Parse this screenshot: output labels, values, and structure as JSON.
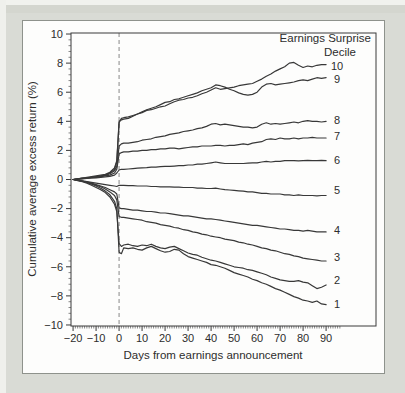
{
  "figure": {
    "name": "post-earnings-announcement-drift-figure"
  },
  "colors": {
    "page_background": "#d9dbd5",
    "panel_background": "#fdfdfc",
    "panel_border": "#8e928c",
    "axis": "#3a3a3a",
    "line": "#383838",
    "event_line": "#878787",
    "text": "#2d2d2d"
  },
  "chart_data": {
    "type": "line",
    "title": "",
    "legend_title": [
      "Earnings Surprise",
      "Decile"
    ],
    "xlabel": "Days from earnings announcement",
    "ylabel": "Cumulative average excess return (%)",
    "grid": false,
    "legend_position": "top-right",
    "xlim": [
      -20.9,
      111.7
    ],
    "ylim": [
      -10.07,
      10.07
    ],
    "x_tick_values": [
      -20,
      -10,
      0,
      10,
      20,
      30,
      40,
      50,
      60,
      70,
      80,
      90
    ],
    "x_tick_labels": [
      "−20",
      "−10",
      "0",
      "10",
      "20",
      "30",
      "40",
      "50",
      "60",
      "70",
      "80",
      "90"
    ],
    "y_tick_values": [
      10,
      8,
      6,
      4,
      2,
      0,
      -2,
      -4,
      -6,
      -8,
      -10
    ],
    "y_tick_labels": [
      "10",
      "8",
      "6",
      "4",
      "2",
      "0",
      "−2",
      "−4",
      "−6",
      "−8",
      "−10"
    ],
    "x_minor_tick_step": 1,
    "x_minor_tick_range": [
      -20,
      96
    ],
    "y_minor_tick_step": 0.4,
    "event_line_x": 0,
    "days": [
      -20,
      -18,
      -16,
      -14,
      -12,
      -10,
      -8,
      -6,
      -4,
      -2,
      -1,
      0,
      1,
      2,
      4,
      6,
      8,
      10,
      12,
      14,
      16,
      18,
      20,
      22,
      24,
      26,
      28,
      30,
      32,
      34,
      36,
      38,
      40,
      42,
      44,
      46,
      48,
      50,
      52,
      54,
      56,
      58,
      60,
      62,
      64,
      66,
      68,
      70,
      72,
      74,
      76,
      78,
      80,
      82,
      84,
      86,
      88,
      90
    ],
    "series": [
      {
        "name": "Decile 10",
        "label": "10",
        "label_y": 7.8,
        "values": [
          0,
          0.05,
          0.1,
          0.1,
          0.15,
          0.2,
          0.25,
          0.3,
          0.45,
          0.7,
          1.2,
          3.9,
          4.2,
          4.25,
          4.3,
          4.4,
          4.5,
          4.6,
          4.75,
          4.8,
          4.9,
          5.0,
          5.05,
          5.2,
          5.35,
          5.45,
          5.5,
          5.6,
          5.65,
          5.75,
          5.9,
          6.0,
          6.15,
          6.3,
          6.2,
          6.25,
          6.3,
          6.35,
          6.45,
          6.5,
          6.55,
          6.6,
          6.75,
          6.9,
          7.1,
          7.25,
          7.45,
          7.6,
          7.75,
          8.0,
          8.05,
          7.85,
          7.7,
          7.8,
          7.75,
          7.85,
          7.9,
          7.9
        ]
      },
      {
        "name": "Decile 9",
        "label": "9",
        "label_y": 6.9,
        "values": [
          0,
          0.05,
          0.1,
          0.15,
          0.2,
          0.25,
          0.3,
          0.35,
          0.5,
          0.8,
          1.3,
          4.0,
          4.1,
          4.15,
          4.2,
          4.35,
          4.5,
          4.65,
          4.8,
          4.9,
          5.0,
          5.15,
          5.3,
          5.35,
          5.5,
          5.55,
          5.65,
          5.75,
          5.85,
          5.95,
          6.1,
          6.2,
          6.3,
          6.5,
          6.45,
          6.35,
          6.2,
          6.1,
          5.95,
          5.85,
          5.8,
          5.85,
          6.0,
          6.35,
          6.55,
          6.6,
          6.5,
          6.55,
          6.6,
          6.65,
          6.7,
          6.8,
          6.85,
          6.8,
          6.9,
          7.0,
          6.95,
          7.0
        ]
      },
      {
        "name": "Decile 8",
        "label": "8",
        "label_y": 4.1,
        "values": [
          0,
          0.05,
          0.08,
          0.1,
          0.15,
          0.2,
          0.22,
          0.28,
          0.4,
          0.6,
          0.9,
          2.3,
          2.45,
          2.5,
          2.5,
          2.55,
          2.6,
          2.7,
          2.75,
          2.8,
          2.9,
          2.95,
          3.0,
          3.1,
          3.15,
          3.2,
          3.3,
          3.35,
          3.4,
          3.5,
          3.55,
          3.65,
          3.8,
          3.85,
          3.75,
          3.8,
          3.75,
          3.7,
          3.65,
          3.6,
          3.6,
          3.55,
          3.6,
          3.8,
          3.9,
          3.8,
          3.85,
          3.8,
          3.85,
          3.9,
          3.95,
          3.9,
          4.0,
          4.05,
          4.0,
          4.0,
          3.95,
          4.0
        ]
      },
      {
        "name": "Decile 7",
        "label": "7",
        "label_y": 2.95,
        "values": [
          0,
          0.03,
          0.06,
          0.1,
          0.12,
          0.15,
          0.2,
          0.25,
          0.3,
          0.45,
          0.7,
          1.75,
          1.85,
          1.9,
          1.9,
          1.95,
          1.95,
          2.0,
          2.0,
          2.05,
          2.05,
          2.1,
          2.1,
          2.15,
          2.15,
          2.1,
          2.15,
          2.2,
          2.25,
          2.25,
          2.3,
          2.3,
          2.3,
          2.35,
          2.35,
          2.3,
          2.35,
          2.35,
          2.4,
          2.45,
          2.4,
          2.5,
          2.55,
          2.6,
          2.75,
          2.8,
          2.75,
          2.85,
          2.8,
          2.8,
          2.85,
          2.8,
          2.85,
          2.85,
          2.9,
          2.85,
          2.85,
          2.85
        ]
      },
      {
        "name": "Decile 6",
        "label": "6",
        "label_y": 1.35,
        "values": [
          0,
          0.02,
          0.05,
          0.08,
          0.1,
          0.12,
          0.15,
          0.18,
          0.22,
          0.3,
          0.45,
          0.65,
          0.7,
          0.7,
          0.72,
          0.75,
          0.78,
          0.8,
          0.82,
          0.85,
          0.85,
          0.88,
          0.9,
          0.9,
          0.92,
          0.95,
          0.95,
          1.0,
          1.0,
          1.05,
          1.05,
          1.1,
          1.15,
          1.2,
          1.15,
          1.1,
          1.1,
          1.1,
          1.1,
          1.1,
          1.12,
          1.15,
          1.15,
          1.2,
          1.25,
          1.2,
          1.25,
          1.25,
          1.3,
          1.3,
          1.3,
          1.28,
          1.3,
          1.32,
          1.3,
          1.3,
          1.32,
          1.3
        ]
      },
      {
        "name": "Decile 5",
        "label": "5",
        "label_y": -0.75,
        "values": [
          0,
          -0.05,
          -0.1,
          -0.15,
          -0.2,
          -0.25,
          -0.3,
          -0.35,
          -0.4,
          -0.45,
          -0.48,
          -0.4,
          -0.4,
          -0.4,
          -0.42,
          -0.42,
          -0.45,
          -0.45,
          -0.45,
          -0.48,
          -0.48,
          -0.5,
          -0.5,
          -0.5,
          -0.52,
          -0.52,
          -0.55,
          -0.55,
          -0.55,
          -0.6,
          -0.6,
          -0.62,
          -0.62,
          -0.6,
          -0.65,
          -0.7,
          -0.72,
          -0.75,
          -0.78,
          -0.8,
          -0.85,
          -0.85,
          -0.9,
          -0.95,
          -0.95,
          -1.0,
          -1.0,
          -1.0,
          -1.05,
          -1.05,
          -1.1,
          -1.05,
          -1.1,
          -1.1,
          -1.1,
          -1.12,
          -1.1,
          -1.1
        ]
      },
      {
        "name": "Decile 4",
        "label": "4",
        "label_y": -3.5,
        "values": [
          0,
          -0.05,
          -0.1,
          -0.15,
          -0.25,
          -0.35,
          -0.45,
          -0.55,
          -0.7,
          -0.85,
          -1.0,
          -1.95,
          -2.0,
          -2.0,
          -2.05,
          -2.1,
          -2.1,
          -2.15,
          -2.2,
          -2.2,
          -2.25,
          -2.3,
          -2.3,
          -2.35,
          -2.4,
          -2.45,
          -2.5,
          -2.5,
          -2.55,
          -2.6,
          -2.65,
          -2.7,
          -2.7,
          -2.75,
          -2.8,
          -2.85,
          -2.9,
          -2.95,
          -3.0,
          -3.05,
          -3.1,
          -3.15,
          -3.15,
          -3.2,
          -3.25,
          -3.3,
          -3.35,
          -3.4,
          -3.4,
          -3.45,
          -3.5,
          -3.5,
          -3.55,
          -3.5,
          -3.55,
          -3.6,
          -3.6,
          -3.6
        ]
      },
      {
        "name": "Decile 3",
        "label": "3",
        "label_y": -5.35,
        "values": [
          0,
          -0.05,
          -0.12,
          -0.2,
          -0.3,
          -0.4,
          -0.5,
          -0.65,
          -0.85,
          -1.1,
          -1.4,
          -2.55,
          -2.6,
          -2.6,
          -2.65,
          -2.7,
          -2.75,
          -2.8,
          -2.9,
          -2.95,
          -3.0,
          -3.1,
          -3.15,
          -3.2,
          -3.3,
          -3.35,
          -3.45,
          -3.5,
          -3.6,
          -3.65,
          -3.75,
          -3.8,
          -3.9,
          -3.95,
          -4.0,
          -4.1,
          -4.15,
          -4.2,
          -4.3,
          -4.35,
          -4.45,
          -4.5,
          -4.6,
          -4.7,
          -4.75,
          -4.85,
          -4.9,
          -5.0,
          -5.1,
          -5.15,
          -5.25,
          -5.3,
          -5.4,
          -5.45,
          -5.5,
          -5.55,
          -5.6,
          -5.6
        ]
      },
      {
        "name": "Decile 2",
        "label": "2",
        "label_y": -6.95,
        "values": [
          0,
          -0.08,
          -0.15,
          -0.25,
          -0.4,
          -0.55,
          -0.7,
          -0.9,
          -1.2,
          -1.7,
          -2.2,
          -4.4,
          -4.6,
          -4.5,
          -4.45,
          -4.55,
          -4.6,
          -4.5,
          -4.55,
          -4.45,
          -4.6,
          -4.7,
          -4.75,
          -4.65,
          -4.6,
          -4.75,
          -4.9,
          -5.05,
          -5.15,
          -5.2,
          -5.35,
          -5.45,
          -5.55,
          -5.6,
          -5.7,
          -5.8,
          -5.9,
          -6.0,
          -6.05,
          -6.1,
          -6.2,
          -6.25,
          -6.35,
          -6.45,
          -6.55,
          -6.7,
          -6.8,
          -6.9,
          -6.95,
          -7.0,
          -7.0,
          -6.95,
          -7.05,
          -7.1,
          -7.3,
          -7.5,
          -7.4,
          -7.25
        ]
      },
      {
        "name": "Decile 1",
        "label": "1",
        "label_y": -8.55,
        "values": [
          0,
          -0.06,
          -0.12,
          -0.2,
          -0.3,
          -0.45,
          -0.6,
          -0.8,
          -1.05,
          -1.5,
          -2.0,
          -5.0,
          -5.1,
          -4.7,
          -4.75,
          -4.7,
          -4.8,
          -4.85,
          -4.7,
          -4.6,
          -4.75,
          -4.9,
          -5.0,
          -4.95,
          -4.8,
          -4.85,
          -5.1,
          -5.3,
          -5.4,
          -5.5,
          -5.6,
          -5.7,
          -5.85,
          -5.9,
          -6.0,
          -6.1,
          -6.25,
          -6.4,
          -6.5,
          -6.6,
          -6.7,
          -6.85,
          -6.95,
          -7.1,
          -7.2,
          -7.35,
          -7.5,
          -7.6,
          -7.75,
          -7.9,
          -8.05,
          -8.15,
          -8.3,
          -8.35,
          -8.45,
          -8.35,
          -8.55,
          -8.6
        ]
      }
    ]
  }
}
